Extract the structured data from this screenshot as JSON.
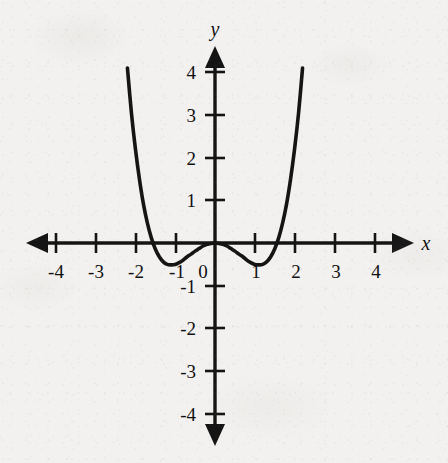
{
  "figure": {
    "background_color": "#f2f1ef",
    "ink_color": "#141414",
    "axis_label_x": "x",
    "axis_label_y": "y",
    "origin_label": "0"
  },
  "chart_data": {
    "type": "line",
    "title": "",
    "subtitle": "",
    "xlabel": "x",
    "ylabel": "y",
    "xlim": [
      -4.6,
      4.6
    ],
    "ylim": [
      -4.6,
      4.6
    ],
    "grid": false,
    "legend": null,
    "annotations": [],
    "x_tick_labels": [
      "-4",
      "-3",
      "-2",
      "-1",
      "0",
      "1",
      "2",
      "3",
      "4"
    ],
    "x_tick_values": [
      -4,
      -3,
      -2,
      -1,
      0,
      1,
      2,
      3,
      4
    ],
    "y_tick_labels": [
      "4",
      "3",
      "2",
      "1",
      "-1",
      "-2",
      "-3",
      "-4"
    ],
    "y_tick_values": [
      4,
      3,
      2,
      1,
      -1,
      -2,
      -3,
      -4
    ],
    "axes_style": "double-arrow cartesian axes, ticks on axes, no gridlines",
    "series": [
      {
        "name": "quartic curve",
        "equation": "y = 0.35x^4 - 0.85x^2",
        "roots": [
          -1.56,
          0,
          1.56
        ],
        "double_root_at": 0,
        "local_minima": [
          {
            "x": -1.1,
            "y": -0.52
          },
          {
            "x": 1.1,
            "y": -0.52
          }
        ],
        "local_maximum": {
          "x": 0,
          "y": 0
        },
        "visible_x_range": [
          -2.2,
          2.45
        ],
        "visible_y_max": 4.25,
        "x": [
          -2.2,
          -2.1,
          -2.0,
          -1.9,
          -1.8,
          -1.7,
          -1.6,
          -1.5,
          -1.4,
          -1.3,
          -1.2,
          -1.1,
          -1.0,
          -0.9,
          -0.8,
          -0.7,
          -0.6,
          -0.5,
          -0.4,
          -0.3,
          -0.2,
          -0.1,
          0.0,
          0.1,
          0.2,
          0.3,
          0.4,
          0.5,
          0.6,
          0.7,
          0.8,
          0.9,
          1.0,
          1.1,
          1.2,
          1.3,
          1.4,
          1.5,
          1.6,
          1.7,
          1.8,
          1.9,
          2.0,
          2.1,
          2.2
        ],
        "y": [
          4.09,
          3.04,
          2.2,
          1.5,
          0.92,
          0.47,
          0.12,
          -0.14,
          -0.32,
          -0.44,
          -0.5,
          -0.51,
          -0.5,
          -0.46,
          -0.4,
          -0.32,
          -0.26,
          -0.19,
          -0.13,
          -0.07,
          -0.03,
          -0.01,
          0.0,
          -0.01,
          -0.03,
          -0.07,
          -0.13,
          -0.19,
          -0.26,
          -0.32,
          -0.4,
          -0.46,
          -0.5,
          -0.51,
          -0.5,
          -0.44,
          -0.32,
          -0.14,
          0.12,
          0.47,
          0.92,
          1.5,
          2.2,
          3.04,
          4.09
        ]
      }
    ]
  },
  "ticks": {
    "x": [
      {
        "label": "-4",
        "value": -4
      },
      {
        "label": "-3",
        "value": -3
      },
      {
        "label": "-2",
        "value": -2
      },
      {
        "label": "-1",
        "value": -1
      },
      {
        "label": "1",
        "value": 1
      },
      {
        "label": "2",
        "value": 2
      },
      {
        "label": "3",
        "value": 3
      },
      {
        "label": "4",
        "value": 4
      }
    ],
    "y": [
      {
        "label": "4",
        "value": 4
      },
      {
        "label": "3",
        "value": 3
      },
      {
        "label": "2",
        "value": 2
      },
      {
        "label": "1",
        "value": 1
      },
      {
        "label": "-1",
        "value": -1
      },
      {
        "label": "-2",
        "value": -2
      },
      {
        "label": "-3",
        "value": -3
      },
      {
        "label": "-4",
        "value": -4
      }
    ]
  }
}
